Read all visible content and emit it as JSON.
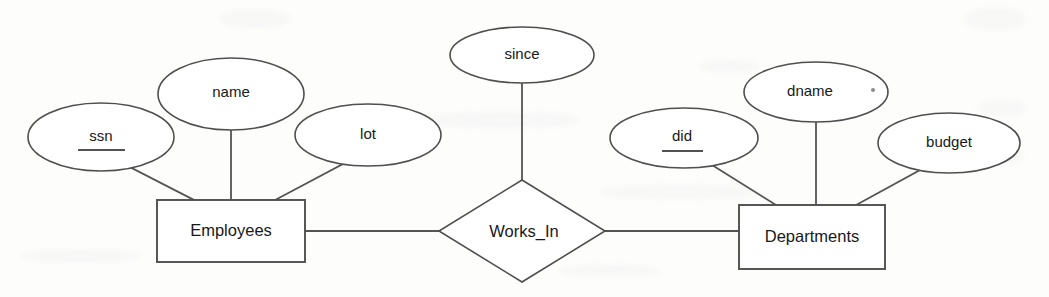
{
  "diagram": {
    "type": "entity-relationship-diagram",
    "notation": "Chen",
    "background_color": "#fdfdfc",
    "stroke_color": "#4f4f4f",
    "text_color": "#181818",
    "entities": [
      {
        "id": "employees",
        "label": "Employees",
        "shape": "rectangle",
        "cx": 231,
        "cy": 231,
        "width": 148,
        "height": 62,
        "attributes": [
          "ssn",
          "name",
          "lot"
        ]
      },
      {
        "id": "departments",
        "label": "Departments",
        "shape": "rectangle",
        "cx": 812,
        "cy": 237,
        "width": 146,
        "height": 64,
        "attributes": [
          "did",
          "dname",
          "budget"
        ]
      }
    ],
    "relationships": [
      {
        "id": "works_in",
        "label": "Works_In",
        "shape": "diamond",
        "cx": 522,
        "cy": 231,
        "width": 166,
        "height": 102,
        "connects": [
          "employees",
          "departments"
        ],
        "attributes": [
          "since"
        ]
      }
    ],
    "attributes": [
      {
        "id": "ssn",
        "label": "ssn",
        "shape": "ellipse",
        "cx": 101,
        "cy": 137,
        "rx": 73,
        "ry": 34,
        "is_key": true,
        "owner": "employees"
      },
      {
        "id": "name",
        "label": "name",
        "shape": "ellipse",
        "cx": 231,
        "cy": 94,
        "rx": 73,
        "ry": 36,
        "is_key": false,
        "owner": "employees"
      },
      {
        "id": "lot",
        "label": "lot",
        "shape": "ellipse",
        "cx": 368,
        "cy": 135,
        "rx": 73,
        "ry": 31,
        "is_key": false,
        "owner": "employees"
      },
      {
        "id": "since",
        "label": "since",
        "shape": "ellipse",
        "cx": 522,
        "cy": 55,
        "rx": 72,
        "ry": 28,
        "is_key": false,
        "owner": "works_in"
      },
      {
        "id": "did",
        "label": "did",
        "shape": "ellipse",
        "cx": 684,
        "cy": 138,
        "rx": 74,
        "ry": 30,
        "is_key": true,
        "owner": "departments"
      },
      {
        "id": "dname",
        "label": "dname",
        "shape": "ellipse",
        "cx": 816,
        "cy": 92,
        "rx": 72,
        "ry": 30,
        "is_key": false,
        "owner": "departments"
      },
      {
        "id": "budget",
        "label": "budget",
        "shape": "ellipse",
        "cx": 949,
        "cy": 143,
        "rx": 71,
        "ry": 30,
        "is_key": false,
        "owner": "departments"
      }
    ],
    "edges": [
      {
        "id": "edge-ssn-employees",
        "from": "ssn",
        "to": "employees",
        "x1": 126,
        "y1": 165,
        "x2": 194,
        "y2": 200
      },
      {
        "id": "edge-name-employees",
        "from": "name",
        "to": "employees",
        "x1": 231,
        "y1": 130,
        "x2": 231,
        "y2": 200
      },
      {
        "id": "edge-lot-employees",
        "from": "lot",
        "to": "employees",
        "x1": 343,
        "y1": 164,
        "x2": 275,
        "y2": 200
      },
      {
        "id": "edge-since-worksin",
        "from": "since",
        "to": "works_in",
        "x1": 522,
        "y1": 83,
        "x2": 522,
        "y2": 180
      },
      {
        "id": "edge-employees-worksin",
        "from": "employees",
        "to": "works_in",
        "x1": 305,
        "y1": 231,
        "x2": 439,
        "y2": 231
      },
      {
        "id": "edge-worksin-departments",
        "from": "works_in",
        "to": "departments",
        "x1": 605,
        "y1": 231,
        "x2": 739,
        "y2": 231
      },
      {
        "id": "edge-did-departments",
        "from": "did",
        "to": "departments",
        "x1": 712,
        "y1": 165,
        "x2": 776,
        "y2": 205
      },
      {
        "id": "edge-dname-departments",
        "from": "dname",
        "to": "departments",
        "x1": 816,
        "y1": 122,
        "x2": 816,
        "y2": 205
      },
      {
        "id": "edge-budget-departments",
        "from": "budget",
        "to": "departments",
        "x1": 922,
        "y1": 168,
        "x2": 855,
        "y2": 205
      }
    ],
    "artifacts": [
      {
        "id": "speck-dname",
        "cx": 873,
        "cy": 90,
        "r": 2
      }
    ]
  }
}
